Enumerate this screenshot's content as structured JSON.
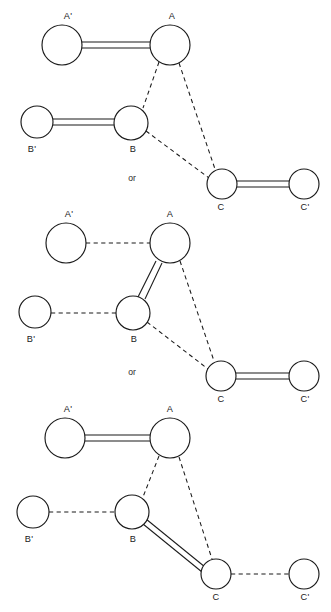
{
  "diagram": {
    "separator_text": "or",
    "line_styles": {
      "full_bond": "double-solid",
      "partial_bond": "dashed"
    },
    "colors": {
      "stroke": "#1a1a1a",
      "fill": "#ffffff",
      "background": "#ffffff"
    },
    "labels": {
      "a_prime": "A'",
      "a": "A",
      "b_prime": "B'",
      "b": "B",
      "c": "C",
      "c_prime": "C'"
    },
    "panels": [
      {
        "id": "panel-1",
        "nodes": [
          {
            "name": "A'",
            "cx": 62,
            "cy": 45,
            "r": 20
          },
          {
            "name": "A",
            "cx": 170,
            "cy": 45,
            "r": 20
          },
          {
            "name": "B'",
            "cx": 37,
            "cy": 122,
            "r": 16
          },
          {
            "name": "B",
            "cx": 131,
            "cy": 123,
            "r": 17
          },
          {
            "name": "C",
            "cx": 222,
            "cy": 184,
            "r": 15
          },
          {
            "name": "C'",
            "cx": 304,
            "cy": 184,
            "r": 15
          }
        ],
        "bonds": [
          {
            "from": "A'",
            "to": "A",
            "style": "double-solid"
          },
          {
            "from": "B'",
            "to": "B",
            "style": "double-solid"
          },
          {
            "from": "C",
            "to": "C'",
            "style": "double-solid"
          },
          {
            "from": "A",
            "to": "B",
            "style": "dashed"
          },
          {
            "from": "A",
            "to": "C",
            "style": "dashed"
          },
          {
            "from": "B",
            "to": "C",
            "style": "dashed"
          }
        ]
      },
      {
        "id": "panel-2",
        "nodes": [
          {
            "name": "A'",
            "cx": 66,
            "cy": 243,
            "r": 20
          },
          {
            "name": "A",
            "cx": 170,
            "cy": 243,
            "r": 20
          },
          {
            "name": "B'",
            "cx": 35,
            "cy": 312,
            "r": 16
          },
          {
            "name": "B",
            "cx": 133,
            "cy": 313,
            "r": 17
          },
          {
            "name": "C",
            "cx": 221,
            "cy": 376,
            "r": 15
          },
          {
            "name": "C'",
            "cx": 304,
            "cy": 376,
            "r": 15
          }
        ],
        "bonds": [
          {
            "from": "A'",
            "to": "A",
            "style": "dashed"
          },
          {
            "from": "B'",
            "to": "B",
            "style": "dashed"
          },
          {
            "from": "A",
            "to": "B",
            "style": "double-solid"
          },
          {
            "from": "C",
            "to": "C'",
            "style": "double-solid"
          },
          {
            "from": "A",
            "to": "C",
            "style": "dashed"
          },
          {
            "from": "B",
            "to": "C",
            "style": "dashed"
          }
        ]
      },
      {
        "id": "panel-3",
        "nodes": [
          {
            "name": "A'",
            "cx": 65,
            "cy": 438,
            "r": 20
          },
          {
            "name": "A",
            "cx": 170,
            "cy": 438,
            "r": 20
          },
          {
            "name": "B'",
            "cx": 33,
            "cy": 512,
            "r": 16
          },
          {
            "name": "B",
            "cx": 132,
            "cy": 512,
            "r": 17
          },
          {
            "name": "C",
            "cx": 216,
            "cy": 574,
            "r": 15
          },
          {
            "name": "C'",
            "cx": 304,
            "cy": 574,
            "r": 15
          }
        ],
        "bonds": [
          {
            "from": "A'",
            "to": "A",
            "style": "double-solid"
          },
          {
            "from": "B'",
            "to": "B",
            "style": "dashed"
          },
          {
            "from": "B",
            "to": "C",
            "style": "double-solid"
          },
          {
            "from": "C",
            "to": "C'",
            "style": "dashed"
          },
          {
            "from": "A",
            "to": "B",
            "style": "dashed"
          },
          {
            "from": "A",
            "to": "C",
            "style": "dashed"
          }
        ]
      }
    ],
    "separators": [
      {
        "x": 132,
        "y": 181
      },
      {
        "x": 132,
        "y": 375
      }
    ]
  }
}
